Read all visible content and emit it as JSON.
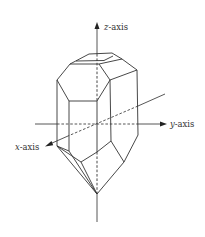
{
  "diagram": {
    "title": "",
    "axes": {
      "z": {
        "var": "z",
        "suffix": "-axis",
        "label": "z-axis"
      },
      "y": {
        "var": "y",
        "suffix": "-axis",
        "label": "y-axis"
      },
      "x": {
        "var": "x",
        "suffix": "-axis",
        "label": "x-axis"
      }
    },
    "colors": {
      "line": "#333333",
      "background": "#ffffff"
    }
  }
}
